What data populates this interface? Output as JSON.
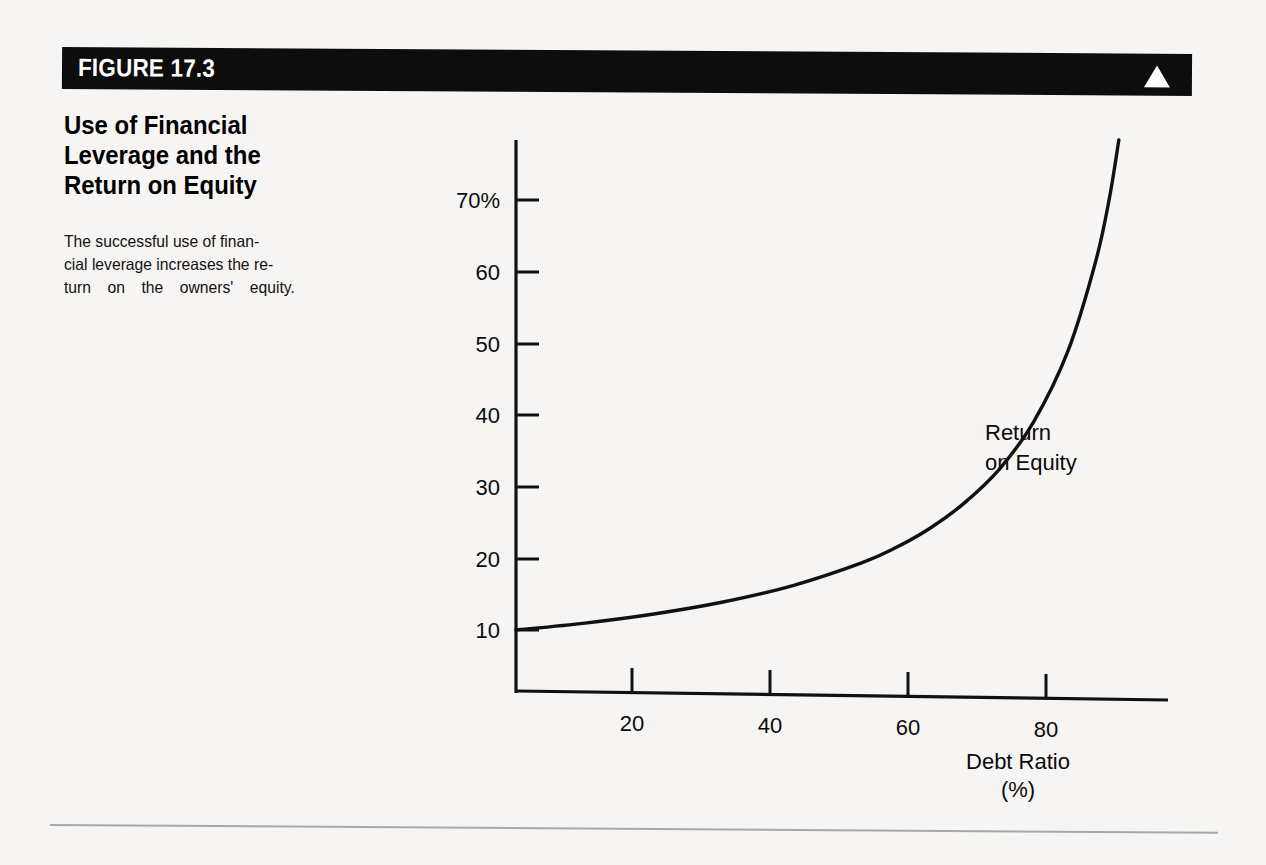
{
  "figure": {
    "number_label": "FIGURE 17.3",
    "heading_lines": [
      "Use of Financial",
      "Leverage and the",
      "Return on Equity"
    ],
    "caption_lines": [
      "The successful use of finan-",
      "cial leverage increases the re-",
      "turn on the owners' equity."
    ],
    "banner_color": "#0d0d0d",
    "banner_text_color": "#ffffff",
    "marker_icon": "triangle-up-icon"
  },
  "chart_data": {
    "type": "line",
    "title": "Use of Financial Leverage and the Return on Equity",
    "xlabel": "Debt Ratio",
    "xlabel_unit": "(%)",
    "ylabel": "",
    "xlim": [
      0,
      90
    ],
    "ylim": [
      0,
      80
    ],
    "grid": false,
    "legend": "inline-annotation",
    "x_ticks": [
      20,
      40,
      60,
      80
    ],
    "x_tick_labels": [
      "20",
      "40",
      "60",
      "80"
    ],
    "y_ticks": [
      10,
      20,
      30,
      40,
      50,
      60,
      70
    ],
    "y_tick_labels": [
      "10",
      "20",
      "30",
      "40",
      "50",
      "60",
      "70%"
    ],
    "series": [
      {
        "name": "Return on Equity",
        "annotation_lines": [
          "Return",
          "on Equity"
        ],
        "color": "#111111",
        "formula": "ROE = 10 / (1 - DebtRatio)",
        "x": [
          0,
          10,
          20,
          30,
          40,
          50,
          55,
          60,
          65,
          70,
          75,
          80,
          84,
          86,
          88,
          89,
          90
        ],
        "values": [
          10,
          11.1,
          12.5,
          14.3,
          16.7,
          20,
          22.2,
          25,
          28.6,
          33.3,
          40,
          50,
          62.5,
          71.4,
          83.3,
          90.9,
          100
        ]
      }
    ]
  }
}
